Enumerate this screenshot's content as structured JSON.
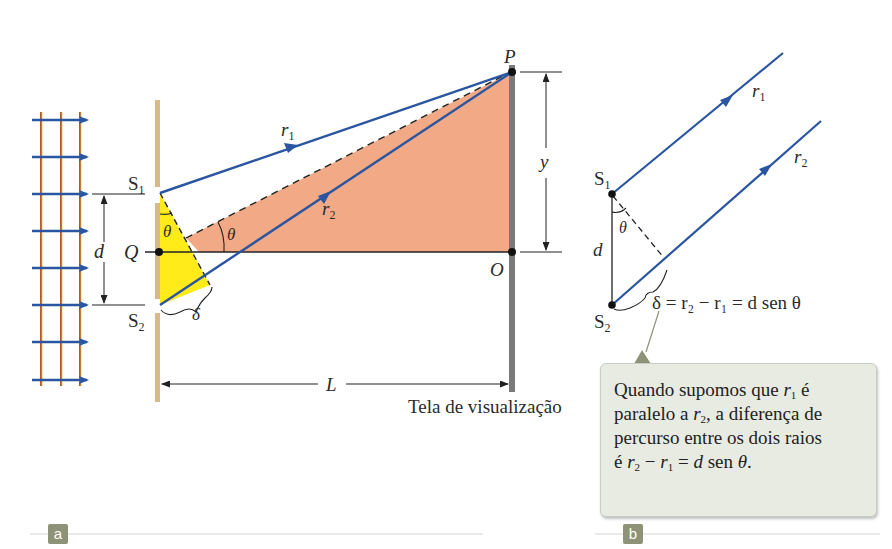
{
  "figure": {
    "panel_a": {
      "tag": "a",
      "labels": {
        "S1": "S",
        "S1_sub": "1",
        "S2": "S",
        "S2_sub": "2",
        "Q": "Q",
        "P": "P",
        "O": "O",
        "d": "d",
        "y": "y",
        "L": "L",
        "r1": "r",
        "r1_sub": "1",
        "r2": "r",
        "r2_sub": "2",
        "theta_1": "θ",
        "theta_2": "θ",
        "delta": "δ",
        "screen": "Tela de visualização"
      }
    },
    "panel_b": {
      "tag": "b",
      "labels": {
        "S1": "S",
        "S1_sub": "1",
        "S2": "S",
        "S2_sub": "2",
        "d": "d",
        "theta": "θ",
        "r1": "r",
        "r1_sub": "1",
        "r2": "r",
        "r2_sub": "2",
        "equation": "δ = r₂ − r₁ = d sen θ"
      },
      "callout": {
        "line1_a": "Quando supomos que ",
        "line1_r": "r",
        "line1_sub": "1",
        "line1_b": " é",
        "line2_a": "paralelo a ",
        "line2_r": "r",
        "line2_sub": "2",
        "line2_b": ", a diferença de",
        "line3": "percurso entre os dois raios",
        "line4_a": "é ",
        "line4_r2": "r",
        "line4_sub2": "2",
        "line4_minus": " − ",
        "line4_r1": "r",
        "line4_sub1": "1",
        "line4_eq": " = ",
        "line4_d": "d",
        "line4_sen": " sen ",
        "line4_theta": "θ",
        "line4_end": "."
      }
    },
    "colors": {
      "ray": "#2a55a0",
      "wavefront": "#b25a2a",
      "barrier": "#d9b98a",
      "screen": "#7a7a7a",
      "path_triangle": "#f2a985",
      "delta_triangle": "#ffeb1a",
      "callout_bg": "#e8ebe2",
      "tag_bg": "#8e9277"
    }
  }
}
